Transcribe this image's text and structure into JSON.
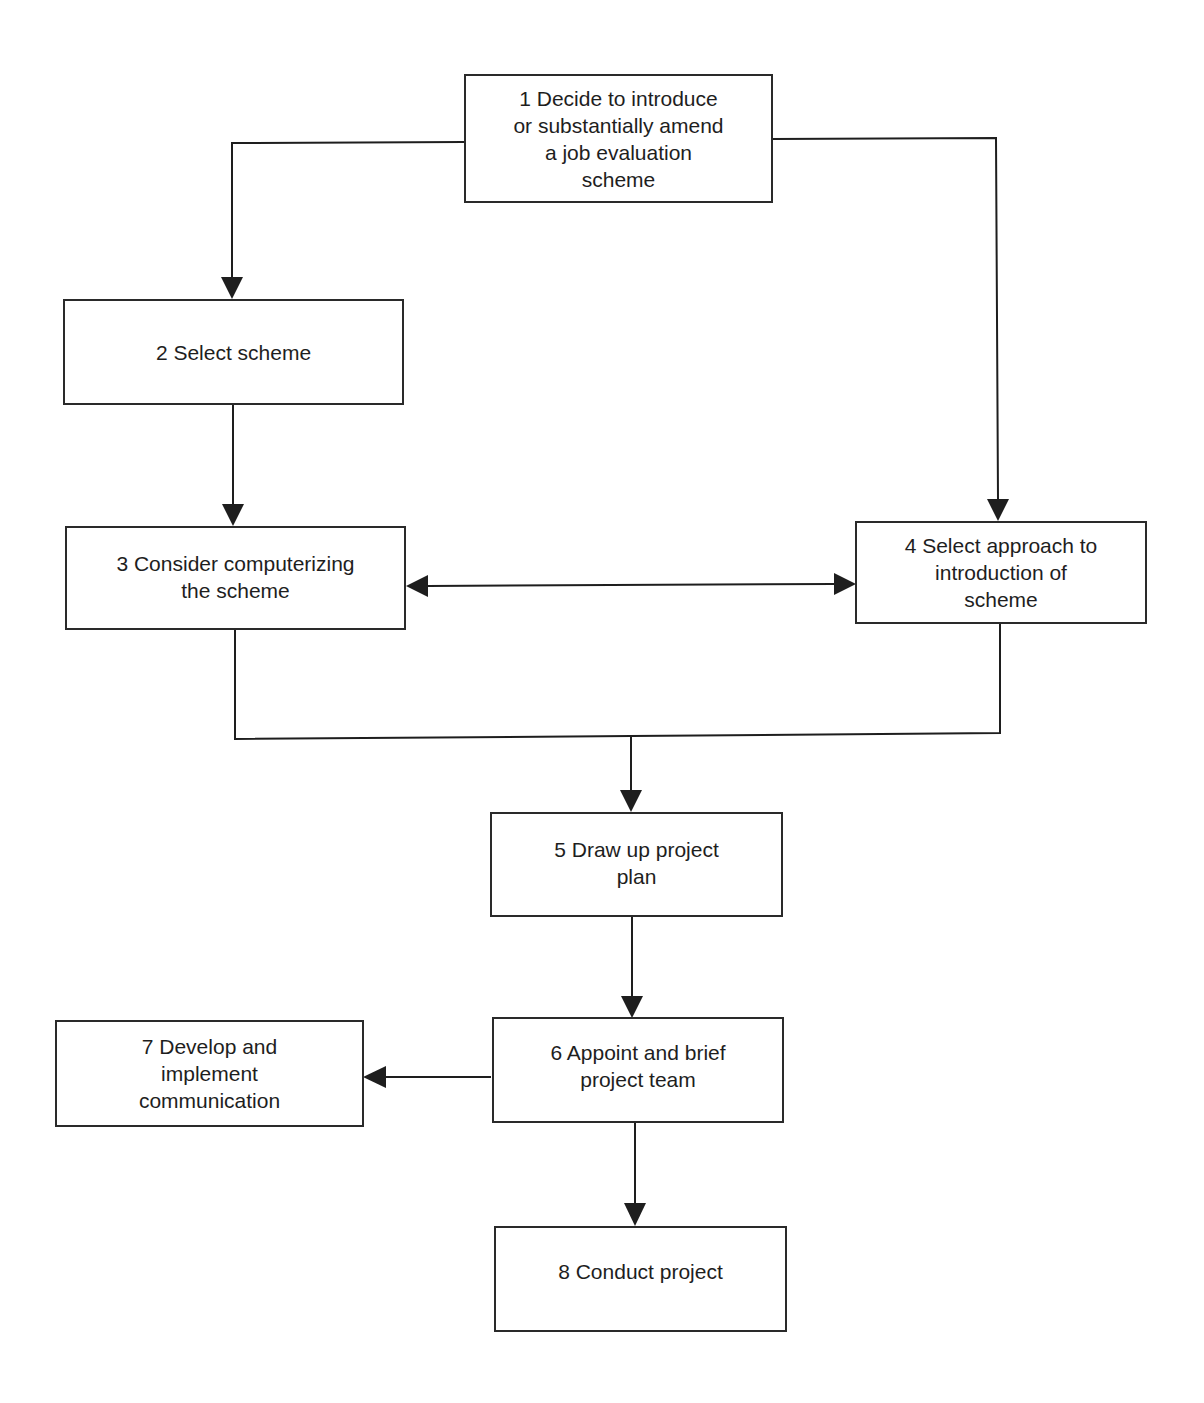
{
  "diagram": {
    "type": "flowchart",
    "nodes": [
      {
        "id": 1,
        "label": "1 Decide to introduce\nor substantially amend\na job evaluation\nscheme"
      },
      {
        "id": 2,
        "label": "2 Select scheme"
      },
      {
        "id": 3,
        "label": "3 Consider computerizing\nthe scheme"
      },
      {
        "id": 4,
        "label": "4 Select approach to\nintroduction of\nscheme"
      },
      {
        "id": 5,
        "label": "5 Draw up project\nplan"
      },
      {
        "id": 6,
        "label": "6 Appoint and brief\nproject team"
      },
      {
        "id": 7,
        "label": "7 Develop  and\nimplement\ncommunication"
      },
      {
        "id": 8,
        "label": "8 Conduct project"
      }
    ],
    "edges": [
      {
        "from": 1,
        "to": 2,
        "direction": "forward"
      },
      {
        "from": 1,
        "to": 4,
        "direction": "forward"
      },
      {
        "from": 2,
        "to": 3,
        "direction": "forward"
      },
      {
        "from": 3,
        "to": 4,
        "direction": "bidirectional"
      },
      {
        "from": 3,
        "to": 5,
        "direction": "forward",
        "merge": true
      },
      {
        "from": 4,
        "to": 5,
        "direction": "forward",
        "merge": true
      },
      {
        "from": 5,
        "to": 6,
        "direction": "forward"
      },
      {
        "from": 6,
        "to": 7,
        "direction": "forward"
      },
      {
        "from": 6,
        "to": 8,
        "direction": "forward"
      }
    ],
    "colors": {
      "line": "#1e1e1e",
      "box_border": "#2a2a2a",
      "background": "#ffffff"
    }
  }
}
